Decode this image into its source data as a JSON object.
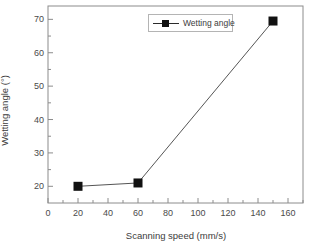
{
  "chart_data": {
    "type": "line",
    "title": "",
    "xlabel": "Scanning speed (mm/s)",
    "ylabel": "Wetting angle (°)",
    "xlim": [
      0,
      170
    ],
    "ylim": [
      15,
      74
    ],
    "grid": false,
    "legend_position": "top-center",
    "series": [
      {
        "name": "Wetting angle",
        "marker": "filled-square",
        "color": "#111111",
        "x": [
          20,
          60,
          150
        ],
        "values": [
          20.0,
          21.0,
          69.5
        ]
      }
    ],
    "x_ticks": [
      0,
      20,
      40,
      60,
      80,
      100,
      120,
      140,
      160
    ],
    "x_tick_labels": [
      "0",
      "20",
      "40",
      "60",
      "80",
      "100",
      "120",
      "140",
      "160"
    ],
    "x_minor_ticks": [
      10,
      30,
      50,
      70,
      90,
      110,
      130,
      150,
      170
    ],
    "y_ticks": [
      20,
      30,
      40,
      50,
      60,
      70
    ],
    "y_tick_labels": [
      "20",
      "30",
      "40",
      "50",
      "60",
      "70"
    ],
    "y_minor_ticks": [
      25,
      35,
      45,
      55,
      65
    ]
  },
  "legend": {
    "entries": [
      {
        "label": "Wetting angle"
      }
    ]
  },
  "axes": {
    "x_title": "Scanning speed (mm/s)",
    "y_title": "Wetting angle (°)"
  },
  "colors": {
    "line": "#555555",
    "marker": "#111111",
    "frame": "#8c8c8c",
    "text": "#3c3c3c"
  }
}
